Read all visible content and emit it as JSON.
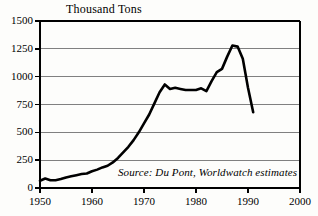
{
  "chart_data": {
    "type": "line",
    "title": "Thousand Tons",
    "xlabel": "",
    "ylabel": "Thousand Tons",
    "xlim": [
      1950,
      2000
    ],
    "ylim": [
      0,
      1500
    ],
    "grid": true,
    "legend": null,
    "ytick_labels": [
      "1500",
      "1250",
      "1000",
      "750",
      "500",
      "250",
      "0"
    ],
    "ytick_values": [
      1500,
      1250,
      1000,
      750,
      500,
      250,
      0
    ],
    "xtick_labels": [
      "1950",
      "1960",
      "1970",
      "1980",
      "1990",
      "2000"
    ],
    "xtick_values": [
      1950,
      1960,
      1970,
      1980,
      1990,
      2000
    ],
    "annotation": "Source: Du Pont, Worldwatch estimates",
    "line_color": "#000000",
    "grid_color": "#808080",
    "axis_color": "#000000",
    "series": [
      {
        "name": "CFC production",
        "x": [
          1950,
          1951,
          1952,
          1953,
          1954,
          1955,
          1956,
          1957,
          1958,
          1959,
          1960,
          1961,
          1962,
          1963,
          1964,
          1965,
          1966,
          1967,
          1968,
          1969,
          1970,
          1971,
          1972,
          1973,
          1974,
          1975,
          1976,
          1977,
          1978,
          1979,
          1980,
          1981,
          1982,
          1983,
          1984,
          1985,
          1986,
          1987,
          1988,
          1989,
          1990,
          1991
        ],
        "values": [
          65,
          85,
          70,
          70,
          80,
          95,
          105,
          115,
          125,
          130,
          150,
          165,
          185,
          200,
          230,
          270,
          320,
          370,
          430,
          500,
          580,
          660,
          760,
          860,
          930,
          890,
          900,
          890,
          880,
          880,
          880,
          895,
          870,
          960,
          1040,
          1070,
          1180,
          1280,
          1270,
          1160,
          900,
          680
        ]
      }
    ]
  },
  "figure": {
    "axis_title": "Thousand Tons",
    "source": "Source: Du Pont, Worldwatch estimates"
  }
}
